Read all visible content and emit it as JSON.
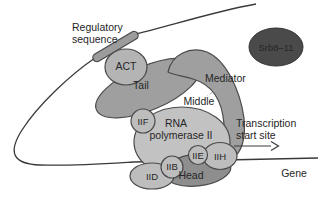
{
  "figure": {
    "dna": {
      "regulatory_label_line1": "Regulatory",
      "regulatory_label_line2": "sequence",
      "transcription_label_line1": "Transcription",
      "transcription_label_line2": "start site",
      "gene_label": "Gene"
    },
    "activator": {
      "label": "ACT"
    },
    "mediator": {
      "label": "Mediator",
      "tail_label": "Tail",
      "middle_label": "Middle",
      "head_label": "Head",
      "srb_module_label": "Srb8–11"
    },
    "polymerase": {
      "name_line1": "RNA",
      "name_line2": "polymerase II"
    },
    "general_factors": {
      "iif": "IIF",
      "iid": "IID",
      "iib": "IIB",
      "iie": "IIE",
      "iih": "IIH"
    },
    "colors": {
      "background": "#ffffff",
      "dna_line": "#3a3a3a",
      "outline": "#4a4a4a",
      "regulatory_bar": "#9c9c9c",
      "act_fill": "#b4b4b4",
      "mediator_fill": "#9f9f9f",
      "head_fill": "#8e8e8e",
      "polymerase_fill": "#c2c2c2",
      "factor_fill": "#bdbdbd",
      "srb_fill": "#4a4a4a",
      "text": "#262626",
      "pointer_dash": "#aaaaaa"
    }
  }
}
